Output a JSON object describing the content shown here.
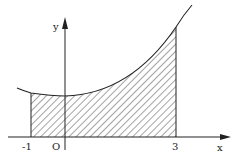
{
  "diagram": {
    "type": "area-under-curve",
    "axes": {
      "x_label": "x",
      "y_label": "y",
      "origin_label": "O"
    },
    "ticks": [
      {
        "label": "-1",
        "value": -1
      },
      {
        "label": "3",
        "value": 3
      }
    ],
    "shaded_region": {
      "from": -1,
      "to": 3,
      "pattern": "diagonal-hatch"
    },
    "colors": {
      "ink": "#222222",
      "background": "#ffffff"
    }
  }
}
